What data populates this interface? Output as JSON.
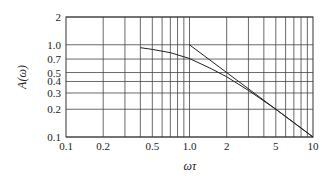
{
  "chart_data": {
    "type": "line",
    "title": "",
    "xlabel": "ωτ",
    "ylabel": "A(ω)",
    "xscale": "log",
    "yscale": "log",
    "xlim": [
      0.1,
      10
    ],
    "ylim": [
      0.1,
      2
    ],
    "grid": true,
    "x_ticks": [
      "0.1",
      "0.2",
      "0.5",
      "1.0",
      "2",
      "5",
      "10"
    ],
    "y_ticks": [
      "2",
      "1.0",
      "0.7",
      "0.5",
      "0.4",
      "0.3",
      "0.2",
      "0.1"
    ],
    "series": [
      {
        "name": "A(ω) curve",
        "x": [
          0.4,
          0.5,
          0.7,
          1.0,
          1.5,
          2,
          3,
          5,
          10
        ],
        "y": [
          0.93,
          0.89,
          0.82,
          0.71,
          0.55,
          0.45,
          0.32,
          0.2,
          0.1
        ]
      },
      {
        "name": "asymptote 1/ωτ",
        "x": [
          1.0,
          10
        ],
        "y": [
          1.0,
          0.1
        ]
      }
    ]
  }
}
